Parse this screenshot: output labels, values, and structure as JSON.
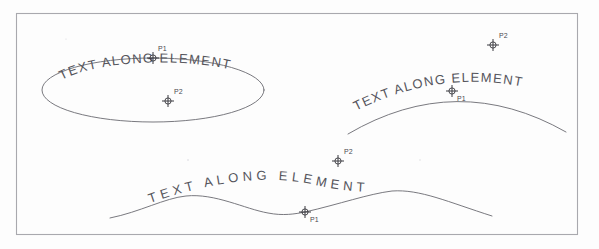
{
  "figure": {
    "kind": "cad-text-along-element-illustration",
    "background_color": "#fdfdfd",
    "frame": {
      "name": "drawing-border",
      "x": 16,
      "y": 13,
      "width": 562,
      "height": 222,
      "stroke": "#a9a9ae"
    },
    "curve_color": "#6a6a70",
    "marker_color": "#3a3a40",
    "text_color": "#55555c"
  },
  "examples": [
    {
      "id": "ellipse-example",
      "element_type": "ellipse",
      "text": "TEXT ALONG ELEMENT",
      "geometry": {
        "cx": 153,
        "cy": 90,
        "rx": 111,
        "ry": 32
      },
      "points": [
        {
          "label": "P1",
          "x": 153,
          "y": 58,
          "label_x": 158,
          "label_y": 51
        },
        {
          "label": "P2",
          "x": 168,
          "y": 101,
          "label_x": 174,
          "label_y": 94
        }
      ]
    },
    {
      "id": "arc-example",
      "element_type": "arc",
      "text": "TEXT ALONG ELEMENT",
      "geometry": {
        "x_start": 348,
        "x_end": 566,
        "apex_x": 457,
        "apex_y": 91,
        "y_end": 133
      },
      "points": [
        {
          "label": "P1",
          "x": 452,
          "y": 91,
          "label_x": 457,
          "label_y": 101
        },
        {
          "label": "P2",
          "x": 493,
          "y": 45,
          "label_x": 499,
          "label_y": 38
        }
      ]
    },
    {
      "id": "spline-example",
      "element_type": "spline",
      "text": "TEXT ALONG ELEMENT",
      "geometry": {
        "x_start": 110,
        "y_start": 218,
        "crest1_x": 186,
        "crest1_y": 196,
        "trough_x": 300,
        "trough_y": 213,
        "crest2_x": 392,
        "crest2_y": 191,
        "x_end": 492,
        "y_end": 216
      },
      "points": [
        {
          "label": "P1",
          "x": 305,
          "y": 212,
          "label_x": 310,
          "label_y": 222
        },
        {
          "label": "P2",
          "x": 338,
          "y": 161,
          "label_x": 344,
          "label_y": 154
        }
      ]
    }
  ]
}
